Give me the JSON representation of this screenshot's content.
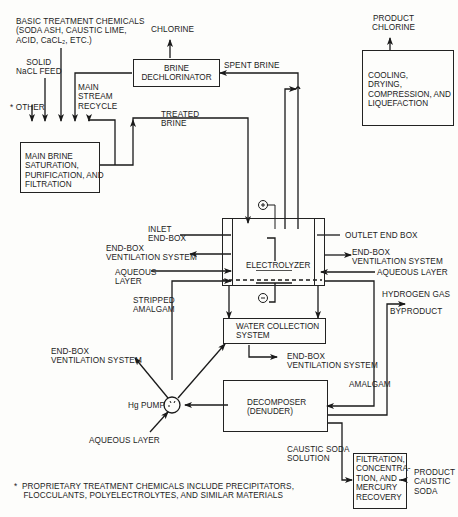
{
  "diagram": {
    "type": "process-flow",
    "nodes": {
      "brine_dechlorinator": "BRINE\nDECHLORINATOR",
      "cooling": "COOLING,\nDRYING,\nCOMPRESSION, AND\nLIQUEFACTION",
      "main_brine": "MAIN BRINE\nSATURATION,\nPURIFICATION, AND\nFILTRATION",
      "electrolyzer": "ELECTROLYZER",
      "water_collection": "WATER COLLECTION\nSYSTEM",
      "decomposer": "DECOMPOSER\n(DENUDER)",
      "filtration": "FILTRATION,\nCONCENTRA-\nTION, AND\nMERCURY\nRECOVERY",
      "hg_pump": "Hg PUMP"
    },
    "labels": {
      "basic_chem": "BASIC TREATMENT CHEMICALS\n(SODA ASH, CAUSTIC LIME,\nACID, CaCL₂, ETC.)",
      "chlorine": "CHLORINE",
      "product_chlorine": "PRODUCT\nCHLORINE",
      "spent_brine": "SPENT BRINE",
      "solid_nacl": "SOLID\nNaCL FEED",
      "main_stream": "MAIN\nSTREAM\nRECYCLE",
      "other": "* OTHER",
      "treated_brine": "TREATED\nBRINE",
      "inlet_endbox": "INLET\nEND-BOX",
      "outlet_endbox": "OUTLET END BOX",
      "endbox_vent_left": "END-BOX\nVENTILATION SYSTEM",
      "endbox_vent_right": "END-BOX\nVENTILATION SYSTEM",
      "aqueous_left": "AQUEOUS\nLAYER",
      "aqueous_right": "AQUEOUS LAYER",
      "stripped_amalgam": "STRIPPED\nAMALGAM",
      "hydrogen": "HYDROGEN GAS",
      "byproduct": "BYPRODUCT",
      "endbox_vent_pump": "END-BOX\nVENTILATION SYSTEM",
      "endbox_vent_wcs": "END-BOX\nVENTILATION SYSTEM",
      "amalgam": "AMALGAM",
      "aqueous_pump": "AQUEOUS LAYER",
      "caustic_solution": "CAUSTIC SODA\nSOLUTION",
      "product_caustic": "PRODUCT\nCAUSTIC\nSODA",
      "plus": "+",
      "minus": "−"
    },
    "footnote": "*  PROPRIETARY TREATMENT CHEMICALS INCLUDE PRECIPITATORS,\n    FLOCCULANTS, POLYELECTROLYTES, AND SIMILAR MATERIALS"
  }
}
